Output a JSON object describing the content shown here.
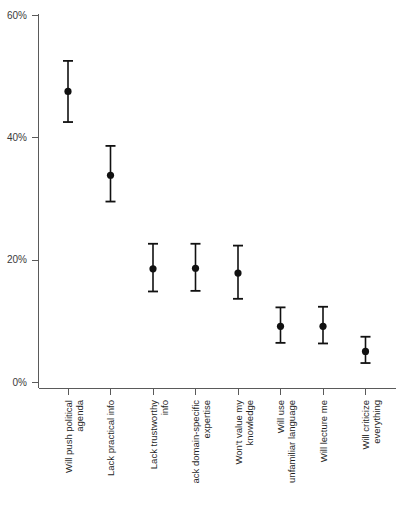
{
  "chart_data": {
    "type": "scatter",
    "title": "",
    "subtitle": "",
    "xlabel": "",
    "ylabel": "",
    "ylim": [
      0,
      60
    ],
    "yunit": "%",
    "grid": false,
    "legend": null,
    "error_bars": "vertical confidence intervals",
    "ytick_labels": [
      "0%",
      "20%",
      "40%",
      "60%"
    ],
    "ytick_values": [
      0,
      20,
      40,
      60
    ],
    "categories": [
      "Will push political agenda",
      "Lack practical info",
      "Lack trustworthy info",
      "ack domain-specific expertise",
      "Won't value my knowledge",
      "Will use unfamiliar language",
      "Will lecture me",
      "Will criticize everything"
    ],
    "values": [
      47.5,
      33.8,
      18.5,
      18.6,
      17.8,
      9.1,
      9.1,
      5.0
    ],
    "ci_low": [
      42.5,
      29.5,
      14.8,
      14.9,
      13.6,
      6.4,
      6.3,
      3.1
    ],
    "ci_high": [
      52.5,
      38.6,
      22.6,
      22.6,
      22.3,
      12.2,
      12.3,
      7.4
    ],
    "point_color": "#111111",
    "axis_color": "#5a5a5a"
  }
}
